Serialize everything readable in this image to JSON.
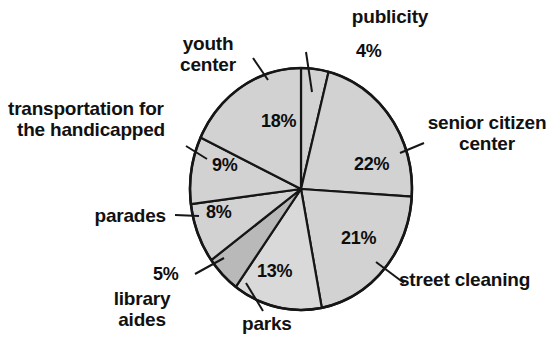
{
  "chart_data": {
    "type": "pie",
    "title": "",
    "subtitle": "",
    "xlabel": "",
    "ylabel": "",
    "legend_position": "none",
    "grid": false,
    "units": "percent",
    "total": 100,
    "categories": [
      "publicity",
      "senior citizen center",
      "street cleaning",
      "parks",
      "library aides",
      "parades",
      "transportation for the handicapped",
      "youth center"
    ],
    "values": [
      4,
      22,
      21,
      13,
      5,
      8,
      9,
      18
    ],
    "value_labels": [
      "4%",
      "22%",
      "21%",
      "13%",
      "5%",
      "8%",
      "9%",
      "18%"
    ],
    "slices": [
      {
        "name": "publicity",
        "label": "publicity",
        "value": 4,
        "value_label": "4%",
        "fill": "#d2d2d2",
        "start_deg": 0,
        "end_deg": 14.4,
        "label_inside": false
      },
      {
        "name": "senior-citizen-center",
        "label": "senior citizen center",
        "value": 22,
        "value_label": "22%",
        "fill": "#d2d2d2",
        "start_deg": 14.4,
        "end_deg": 93.6,
        "label_inside": false
      },
      {
        "name": "street-cleaning",
        "label": "street cleaning",
        "value": 21,
        "value_label": "21%",
        "fill": "#d2d2d2",
        "start_deg": 93.6,
        "end_deg": 169.2,
        "label_inside": false
      },
      {
        "name": "parks",
        "label": "parks",
        "value": 13,
        "value_label": "13%",
        "fill": "#d9d9d9",
        "start_deg": 169.2,
        "end_deg": 216,
        "label_inside": false
      },
      {
        "name": "library-aides",
        "label": "library aides",
        "value": 5,
        "value_label": "5%",
        "fill": "#b9b9b9",
        "start_deg": 216,
        "end_deg": 234,
        "label_inside": false
      },
      {
        "name": "parades",
        "label": "parades",
        "value": 8,
        "value_label": "8%",
        "fill": "#d2d2d2",
        "start_deg": 234,
        "end_deg": 262.8,
        "label_inside": false
      },
      {
        "name": "transportation-for-the-handicapped",
        "label": "transportation for the handicapped",
        "value": 9,
        "value_label": "9%",
        "fill": "#d2d2d2",
        "start_deg": 262.8,
        "end_deg": 295.2,
        "label_inside": false
      },
      {
        "name": "youth-center",
        "label": "youth center",
        "value": 18,
        "value_label": "18%",
        "fill": "#d2d2d2",
        "start_deg": 295.2,
        "end_deg": 360,
        "label_inside": false
      }
    ],
    "colors": {
      "slice_fill": "#d2d2d2",
      "slice_fill_alt": "#b9b9b9",
      "outline": "#161616",
      "background": "#ffffff",
      "text": "#111111"
    }
  },
  "labels": {
    "publicity": "publicity",
    "youth_center_line1": "youth",
    "youth_center_line2": "center",
    "transportation_line1": "transportation for",
    "transportation_line2": "the handicapped",
    "parades": "parades",
    "library_aides_line1": "library",
    "library_aides_line2": "aides",
    "parks": "parks",
    "street_cleaning": "street cleaning",
    "senior_citizen_line1": "senior citizen",
    "senior_citizen_line2": "center"
  },
  "percents": {
    "publicity": "4%",
    "senior_citizen_center": "22%",
    "street_cleaning": "21%",
    "parks": "13%",
    "library_aides": "5%",
    "parades": "8%",
    "transportation": "9%",
    "youth_center": "18%"
  }
}
